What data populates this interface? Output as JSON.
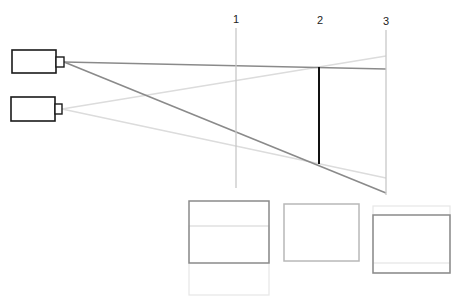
{
  "diagram": {
    "colors": {
      "dark": "#8a8a8a",
      "light": "#dcdcdc",
      "black": "#111111",
      "camera": "#1a1a1a",
      "plane": "#c8c8c8"
    },
    "cameras": [
      {
        "name": "camera-top",
        "body": [
          12,
          50,
          44,
          23
        ],
        "lens": [
          56,
          57,
          8,
          10
        ]
      },
      {
        "name": "camera-bottom",
        "body": [
          11,
          97,
          44,
          24
        ],
        "lens": [
          55,
          104,
          7,
          10
        ]
      }
    ],
    "planes": [
      {
        "label": "1",
        "x": 236,
        "y1": 28,
        "y2": 188,
        "label_x": 234,
        "label_y": 22
      },
      {
        "label": "2",
        "x": 319,
        "y1": 67,
        "y2": 164,
        "label_x": 318,
        "label_y": 23
      },
      {
        "label": "3",
        "x": 386,
        "y1": 30,
        "y2": 195,
        "label_x": 383,
        "label_y": 24
      }
    ],
    "frames": [
      {
        "name": "frame-1",
        "dark": [
          189,
          201,
          80,
          62
        ],
        "light_ext": [
          189,
          201,
          80,
          94
        ],
        "light_line_y": 226
      },
      {
        "name": "frame-2",
        "dark": [
          284,
          204,
          75,
          57
        ]
      },
      {
        "name": "frame-3",
        "light_ext": [
          373,
          206,
          77,
          67
        ],
        "dark": [
          373,
          215,
          77,
          58
        ],
        "light_line_y": 263
      }
    ]
  }
}
